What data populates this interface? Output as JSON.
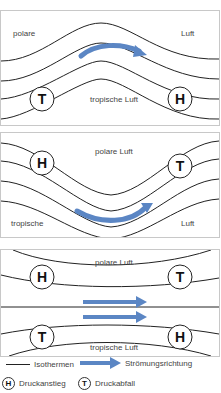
{
  "panels": [
    {
      "id": "panel-1",
      "labels": {
        "top_left": "polare",
        "top_right": "Luft",
        "bottom_center": "tropische Luft"
      },
      "pressure_markers": [
        {
          "symbol": "T",
          "position": "left"
        },
        {
          "symbol": "H",
          "position": "right"
        }
      ],
      "flow": "ridge, arrow pointing right"
    },
    {
      "id": "panel-2",
      "labels": {
        "top_center": "polare Luft",
        "bottom_left": "tropische",
        "bottom_right": "Luft"
      },
      "pressure_markers": [
        {
          "symbol": "H",
          "position": "left"
        },
        {
          "symbol": "T",
          "position": "right"
        }
      ],
      "flow": "trough, arrow pointing right"
    },
    {
      "id": "panel-3",
      "labels": {
        "top_center": "polare Luft",
        "bottom_center": "tropische Luft"
      },
      "pressure_markers": [
        {
          "symbol": "H",
          "position": "top-left"
        },
        {
          "symbol": "T",
          "position": "top-right"
        },
        {
          "symbol": "T",
          "position": "bottom-left"
        },
        {
          "symbol": "H",
          "position": "bottom-right"
        }
      ],
      "flow": "straight, two arrows pointing right"
    }
  ],
  "legend": {
    "isotherm_label": "Isothermen",
    "flow_label": "Strömungsrichtung",
    "high_symbol": "H",
    "high_label": "Druckanstieg",
    "low_symbol": "T",
    "low_label": "Druckabfall"
  },
  "colors": {
    "arrow": "#5b86c4",
    "line": "#222222",
    "border": "#c8c8c8"
  }
}
